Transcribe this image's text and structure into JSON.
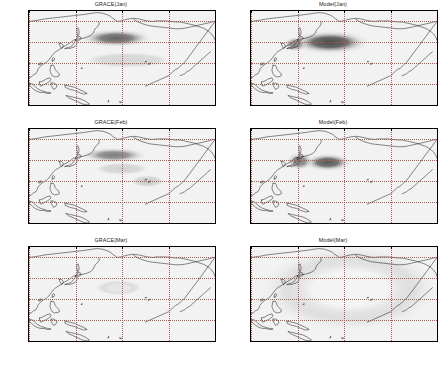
{
  "figure": {
    "layout": "2 columns x 3 rows",
    "columns": [
      "GRACE",
      "Model"
    ],
    "rows": [
      "Jan",
      "Feb",
      "Mar"
    ]
  },
  "axes": {
    "xticks": [
      "100E",
      "140E",
      "180E",
      "140W",
      "100W"
    ],
    "xtick_values": [
      100,
      140,
      180,
      220,
      260
    ],
    "yticks": [
      "60N",
      "40N",
      "20N",
      "Eq",
      "20S"
    ],
    "ytick_values": [
      60,
      40,
      20,
      0,
      -20
    ],
    "xlim": [
      100,
      260
    ],
    "ylim": [
      -20,
      70
    ],
    "grid": "dotted",
    "grid_color": "#b05a4a"
  },
  "panels": [
    {
      "id": "grace-jan",
      "title": "GRACE(Jan)",
      "source": "GRACE",
      "month": "Jan",
      "row": 0,
      "col": 0
    },
    {
      "id": "model-jan",
      "title": "Model(Jan)",
      "source": "Model",
      "month": "Jan",
      "row": 0,
      "col": 1
    },
    {
      "id": "grace-feb",
      "title": "GRACE(Feb)",
      "source": "GRACE",
      "month": "Feb",
      "row": 1,
      "col": 0
    },
    {
      "id": "model-feb",
      "title": "Model(Feb)",
      "source": "Model",
      "month": "Feb",
      "row": 1,
      "col": 1
    },
    {
      "id": "grace-mar",
      "title": "GRACE(Mar)",
      "source": "GRACE",
      "month": "Mar",
      "row": 2,
      "col": 0
    },
    {
      "id": "model-mar",
      "title": "Model(Mar)",
      "source": "Model",
      "month": "Mar",
      "row": 2,
      "col": 1
    }
  ],
  "chart_data": {
    "type": "heatmap",
    "xlabel": "",
    "ylabel": "",
    "xlim": [
      100,
      260
    ],
    "ylim": [
      -20,
      70
    ],
    "grid": true,
    "legend": "none",
    "colormap": "grayscale, dark = high positive anomaly, white = near zero",
    "panels": [
      {
        "title": "GRACE(Jan)",
        "features": [
          {
            "name": "central North Pacific high",
            "lon_range": [
              150,
              205
            ],
            "lat_range": [
              38,
              50
            ],
            "center_lon": 175,
            "center_lat": 44,
            "intensity": 0.72
          },
          {
            "name": "subtropical weak band",
            "lon_range": [
              150,
              215
            ],
            "lat_range": [
              18,
              28
            ],
            "center_lon": 185,
            "center_lat": 23,
            "intensity": 0.2
          }
        ]
      },
      {
        "title": "Model(Jan)",
        "features": [
          {
            "name": "Kuroshio extension high",
            "lon_range": [
              140,
              200
            ],
            "lat_range": [
              32,
              48
            ],
            "center_lon": 168,
            "center_lat": 40,
            "intensity": 0.85
          },
          {
            "name": "Japan Sea lobe",
            "lon_range": [
              130,
              148
            ],
            "lat_range": [
              33,
              43
            ],
            "center_lon": 138,
            "center_lat": 38,
            "intensity": 0.55
          }
        ]
      },
      {
        "title": "GRACE(Feb)",
        "features": [
          {
            "name": "central North Pacific high",
            "lon_range": [
              150,
              200
            ],
            "lat_range": [
              40,
              50
            ],
            "center_lon": 173,
            "center_lat": 45,
            "intensity": 0.6
          },
          {
            "name": "subtropical patch",
            "lon_range": [
              160,
              200
            ],
            "lat_range": [
              28,
              36
            ],
            "center_lon": 180,
            "center_lat": 32,
            "intensity": 0.22
          },
          {
            "name": "eastern subtropical patch",
            "lon_range": [
              190,
              215
            ],
            "lat_range": [
              16,
              24
            ],
            "center_lon": 202,
            "center_lat": 20,
            "intensity": 0.25
          }
        ]
      },
      {
        "title": "Model(Feb)",
        "features": [
          {
            "name": "Kuroshio extension high",
            "lon_range": [
              148,
              185
            ],
            "lat_range": [
              32,
              44
            ],
            "center_lon": 166,
            "center_lat": 38,
            "intensity": 0.78
          },
          {
            "name": "Japan Sea lobe",
            "lon_range": [
              132,
              152
            ],
            "lat_range": [
              33,
              45
            ],
            "center_lon": 142,
            "center_lat": 39,
            "intensity": 0.6
          }
        ]
      },
      {
        "title": "GRACE(Mar)",
        "features": [
          {
            "name": "weak residual central patch",
            "lon_range": [
              160,
              195
            ],
            "lat_range": [
              26,
              36
            ],
            "center_lon": 177,
            "center_lat": 31,
            "intensity": 0.12
          }
        ]
      },
      {
        "title": "Model(Mar)",
        "features": [
          {
            "name": "near-uniform weak field",
            "lon_range": [
              120,
              250
            ],
            "lat_range": [
              0,
              55
            ],
            "center_lon": 185,
            "center_lat": 30,
            "intensity": 0.05
          }
        ]
      }
    ]
  }
}
